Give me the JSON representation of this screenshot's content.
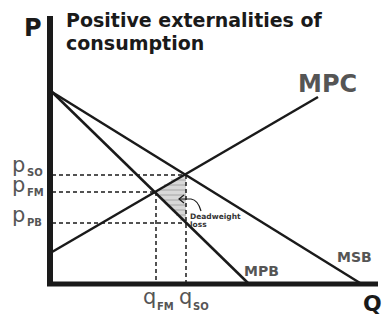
{
  "title_line1": "Positive externalities of",
  "title_line2": "consumption",
  "axes": {
    "y_label": "P",
    "x_label": "Q"
  },
  "curves": {
    "mpc": "MPC",
    "mpb": "MPB",
    "msb": "MSB"
  },
  "price_labels": [
    {
      "main": "p",
      "sub": "SO"
    },
    {
      "main": "p",
      "sub": "FM"
    },
    {
      "main": "p",
      "sub": "PB"
    }
  ],
  "quantity_labels": [
    {
      "main": "q",
      "sub": "FM"
    },
    {
      "main": "q",
      "sub": "SO"
    }
  ],
  "annotation": {
    "line1": "Deadweight",
    "line2": "loss"
  },
  "colors": {
    "lines": "#1a1a1a",
    "labels": "#555555",
    "shading": "#9a9a9a"
  }
}
